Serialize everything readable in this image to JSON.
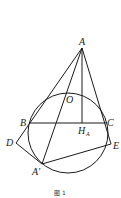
{
  "figure": {
    "caption": "图 1",
    "points": {
      "A": {
        "label": "A",
        "x": 82,
        "y": 48
      },
      "O": {
        "label": "O",
        "x": 68,
        "y": 100
      },
      "B": {
        "label": "B",
        "x": 29,
        "y": 123
      },
      "C": {
        "label": "C",
        "x": 106,
        "y": 123
      },
      "H": {
        "label": "H",
        "sub": "A",
        "x": 82,
        "y": 123
      },
      "D": {
        "label": "D",
        "x": 16,
        "y": 143
      },
      "E": {
        "label": "E",
        "x": 111,
        "y": 144
      },
      "Ap": {
        "label": "A'",
        "x": 42,
        "y": 164
      }
    },
    "circle": {
      "cx": 68,
      "cy": 133,
      "r": 40
    },
    "colors": {
      "stroke": "#1a1a1a",
      "background": "#ffffff"
    }
  }
}
